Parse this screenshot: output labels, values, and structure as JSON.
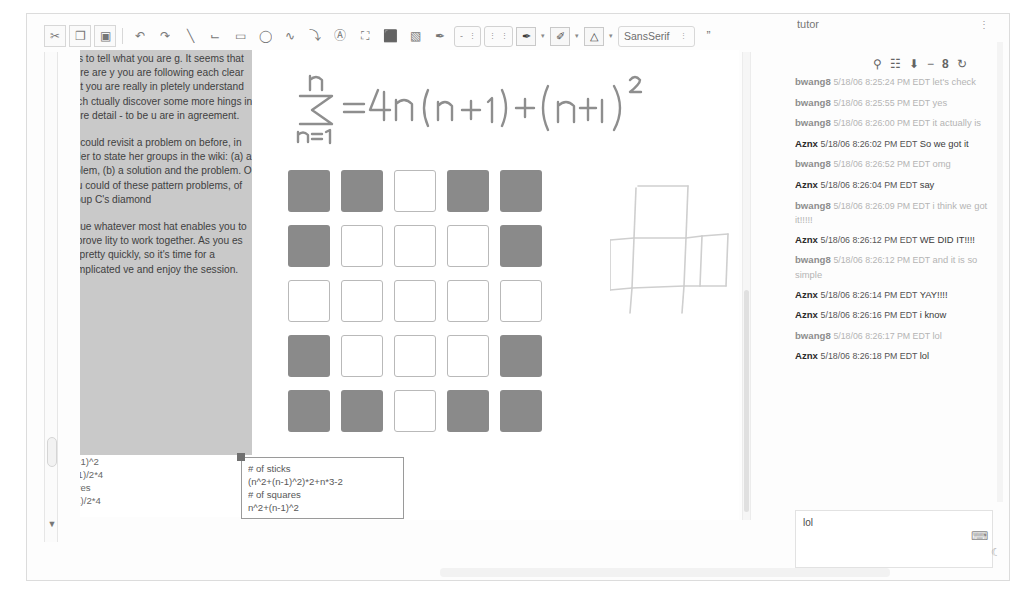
{
  "window": {
    "title_bar_visible": false
  },
  "toolbar": {
    "tools": [
      {
        "name": "cut-icon",
        "glyph": "✂"
      },
      {
        "name": "copy-icon",
        "glyph": "❐"
      },
      {
        "name": "paste-icon",
        "glyph": "▣"
      },
      {
        "name": "undo-icon",
        "glyph": "↶"
      },
      {
        "name": "redo-icon",
        "glyph": "↷"
      },
      {
        "name": "line-tool-icon",
        "glyph": "╲"
      },
      {
        "name": "polyline-tool-icon",
        "glyph": "⌙"
      },
      {
        "name": "rectangle-tool-icon",
        "glyph": "▭"
      },
      {
        "name": "ellipse-tool-icon",
        "glyph": "◯"
      },
      {
        "name": "freehand-tool-icon",
        "glyph": "∿"
      },
      {
        "name": "curve-tool-icon",
        "glyph": "⤵"
      },
      {
        "name": "text-tool-icon",
        "glyph": "Ⓐ"
      },
      {
        "name": "image-tool-icon",
        "glyph": "⛶"
      },
      {
        "name": "stamp-tool-icon",
        "glyph": "⬛"
      },
      {
        "name": "eraser-tool-icon",
        "glyph": "▧"
      },
      {
        "name": "pen-tool-icon",
        "glyph": "✒"
      }
    ],
    "stroke_group": {
      "width_label": "-",
      "width_caret": "⋮",
      "dash_caret_1": "⋮",
      "dash_caret_2": "⋮"
    },
    "color_buttons": [
      {
        "name": "line-color-button",
        "glyph": "✒",
        "caret": "▾"
      },
      {
        "name": "fill-color-button",
        "glyph": "✐",
        "caret": "▾"
      },
      {
        "name": "text-color-button",
        "glyph": "△",
        "caret": "▾"
      }
    ],
    "font_select": {
      "value": "SansSerif",
      "caret": "⋮"
    },
    "quote_button": "”"
  },
  "notes_panel": {
    "paragraphs": [
      "r us to tell what you are g. It seems that there are y you are following each clear that you are really in pletely understand each ctually discover some more hings in more detail - to be u are in agreement.",
      "ou could revisit a problem on before, in order to state her groups in the wiki: (a) a roblem, (b) a solution and the problem. Or you could of these pattern problems, of group C's diamond",
      "ursue whatever most hat enables you to improve lity to work together. As you es by pretty quickly, so it's time for a complicated ve and enjoy the session."
    ]
  },
  "formula_strip": {
    "lines": [
      "n-1)^2",
      "+1)/2*4",
      "ares",
      "-1)/2*4"
    ]
  },
  "whiteboard": {
    "handwritten_formula": {
      "upper_limit": "n",
      "sigma": "Σ",
      "lower_limit": "n=1",
      "right_side": "= 4n (n+1) + (n+1)²"
    },
    "grid": {
      "rows": 5,
      "cols": 5,
      "pattern": [
        [
          1,
          1,
          0,
          1,
          1
        ],
        [
          1,
          0,
          0,
          0,
          1
        ],
        [
          0,
          0,
          0,
          0,
          0
        ],
        [
          1,
          0,
          0,
          0,
          1
        ],
        [
          1,
          1,
          0,
          1,
          1
        ]
      ],
      "filled_color": "#8a8a8a",
      "empty_color": "#ffffff"
    },
    "cross_shape": {
      "name": "plus-shape-sketch",
      "stroke_color": "#c8c8c8"
    },
    "textbox": {
      "lines": [
        "# of sticks",
        "(n^2+(n-1)^2)*2+n*3-2",
        "# of squares",
        "n^2+(n-1)^2"
      ]
    }
  },
  "chat": {
    "title": "tutor",
    "title_button": "⋮",
    "icons": [
      {
        "name": "search-icon",
        "glyph": "⚲"
      },
      {
        "name": "filmstrip-icon",
        "glyph": "☷"
      },
      {
        "name": "download-icon",
        "glyph": "⬇"
      },
      {
        "name": "minimize-icon",
        "glyph": "−"
      },
      {
        "name": "person-icon",
        "glyph": "8"
      },
      {
        "name": "refresh-icon",
        "glyph": "↻"
      }
    ],
    "messages": [
      {
        "who": "bwang8",
        "ts": "5/18/06 8:25:24 PM EDT",
        "body": "let's check",
        "style": "light"
      },
      {
        "who": "bwang8",
        "ts": "5/18/06 8:25:55 PM EDT",
        "body": "yes",
        "style": "light"
      },
      {
        "who": "bwang8",
        "ts": "5/18/06 8:26:00 PM EDT",
        "body": "it actually is",
        "style": "light"
      },
      {
        "who": "Aznx",
        "ts": "5/18/06 8:26:02 PM EDT",
        "body": "So we got it",
        "style": "dark"
      },
      {
        "who": "bwang8",
        "ts": "5/18/06 8:26:52 PM EDT",
        "body": "omg",
        "style": "light"
      },
      {
        "who": "Aznx",
        "ts": "5/18/06 8:26:04 PM EDT",
        "body": "say",
        "style": "dark"
      },
      {
        "who": "bwang8",
        "ts": "5/18/06 8:26:09 PM EDT",
        "body": "i think we got it!!!!!",
        "style": "light"
      },
      {
        "who": "Aznx",
        "ts": "5/18/06 8:26:12 PM EDT",
        "body": "WE DID IT!!!!",
        "style": "dark"
      },
      {
        "who": "bwang8",
        "ts": "5/18/06 8:26:12 PM EDT",
        "body": "and it is so simple",
        "style": "light"
      },
      {
        "who": "Aznx",
        "ts": "5/18/06 8:26:14 PM EDT",
        "body": "YAY!!!!",
        "style": "dark"
      },
      {
        "who": "Aznx",
        "ts": "5/18/06 8:26:16 PM EDT",
        "body": "i know",
        "style": "dark"
      },
      {
        "who": "bwang8",
        "ts": "5/18/06 8:26:17 PM EDT",
        "body": "lol",
        "style": "light"
      },
      {
        "who": "Aznx",
        "ts": "5/18/06 8:26:18 PM EDT",
        "body": "lol",
        "style": "dark"
      }
    ],
    "input": {
      "value": "lol",
      "placeholder": "",
      "send_icon": "⌨",
      "corner_icon": "☾"
    }
  }
}
